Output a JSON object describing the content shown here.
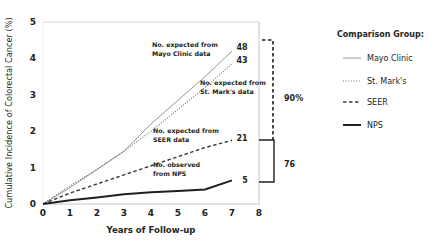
{
  "chart_data": {
    "type": "line",
    "title": "",
    "xlabel": "Years of Follow-up",
    "ylabel": "Cumulative Incidence of Colorectal Cancer (%)",
    "xlim": [
      0,
      8
    ],
    "ylim": [
      0,
      5
    ],
    "x_ticks": [
      0,
      1,
      2,
      3,
      4,
      5,
      6,
      7,
      8
    ],
    "y_ticks": [
      0,
      1,
      2,
      3,
      4,
      5
    ],
    "grid": false,
    "x": [
      0,
      1,
      2,
      3,
      4,
      5,
      6,
      7
    ],
    "series": [
      {
        "name": "Mayo Clinic",
        "style": "solid-thin",
        "color": "#8c8c8c",
        "values": [
          0,
          0.45,
          0.95,
          1.45,
          2.2,
          2.85,
          3.5,
          4.2
        ],
        "end_label": "48",
        "annotation": [
          "No. expected from",
          "Mayo Clinic data"
        ]
      },
      {
        "name": "St. Mark's",
        "style": "dotted",
        "color": "#6e6e6e",
        "values": [
          0,
          0.5,
          0.95,
          1.45,
          2.0,
          2.6,
          3.2,
          3.85
        ],
        "end_label": "43",
        "annotation": [
          "No. expected from",
          "St. Mark's data"
        ]
      },
      {
        "name": "SEER",
        "style": "dashed",
        "color": "#3a3a3a",
        "values": [
          0,
          0.3,
          0.55,
          0.8,
          1.05,
          1.3,
          1.55,
          1.75
        ],
        "end_label": "21",
        "annotation": [
          "No. expected from",
          "SEER data"
        ]
      },
      {
        "name": "NPS",
        "style": "solid-thick",
        "color": "#231f20",
        "values": [
          0,
          0.1,
          0.18,
          0.27,
          0.32,
          0.36,
          0.4,
          0.65
        ],
        "end_label": "5",
        "annotation": [
          "No. observed",
          "from NPS"
        ]
      }
    ],
    "brackets": [
      {
        "label": "90%",
        "style": "dashed",
        "from_series": "Mayo Clinic",
        "to_series": "SEER"
      },
      {
        "label": "76",
        "style": "solid",
        "from_series": "SEER",
        "to_series": "NPS"
      }
    ],
    "legend": {
      "title": "Comparison Group:",
      "position": "right",
      "items": [
        "Mayo Clinic",
        "St. Mark's",
        "SEER",
        "NPS"
      ]
    }
  }
}
